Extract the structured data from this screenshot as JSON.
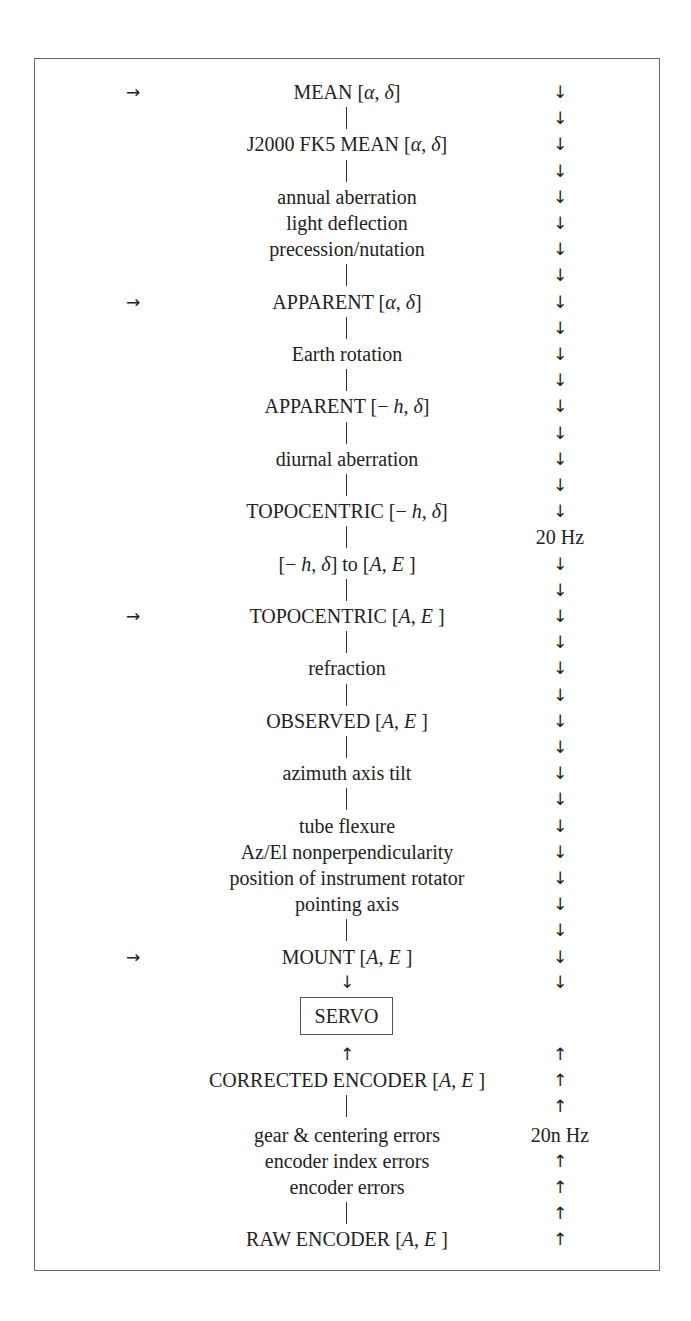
{
  "diagram": {
    "row_top_y": 79,
    "row_pitch": 26.2,
    "down_arrow": "↓",
    "up_arrow": "↑",
    "right_arrow": "→",
    "rows": [
      {
        "text": "MEAN [α, δ]",
        "left": "→",
        "right": "↓"
      },
      {
        "text": "|",
        "right": "↓"
      },
      {
        "text": "J2000 FK5 MEAN [α, δ]",
        "right": "↓"
      },
      {
        "text": "|",
        "right": "↓"
      },
      {
        "text": "annual aberration",
        "right": "↓"
      },
      {
        "text": "light deflection",
        "right": "↓"
      },
      {
        "text": "precession/nutation",
        "right": "↓"
      },
      {
        "text": "|",
        "right": "↓"
      },
      {
        "text": "APPARENT [α, δ]",
        "left": "→",
        "right": "↓"
      },
      {
        "text": "|",
        "right": "↓"
      },
      {
        "text": "Earth rotation",
        "right": "↓"
      },
      {
        "text": "|",
        "right": "↓"
      },
      {
        "text": "APPARENT [− h, δ]",
        "right": "↓"
      },
      {
        "text": "|",
        "right": "↓"
      },
      {
        "text": "diurnal aberration",
        "right": "↓"
      },
      {
        "text": "|",
        "right": "↓"
      },
      {
        "text": "TOPOCENTRIC [− h, δ]",
        "right": "↓"
      },
      {
        "text": "|",
        "right": "20 Hz"
      },
      {
        "text": "[− h, δ] to [A, E]",
        "right": "↓"
      },
      {
        "text": "|",
        "right": "↓"
      },
      {
        "text": "TOPOCENTRIC [A, E]",
        "left": "→",
        "right": "↓"
      },
      {
        "text": "|",
        "right": "↓"
      },
      {
        "text": "refraction",
        "right": "↓"
      },
      {
        "text": "|",
        "right": "↓"
      },
      {
        "text": "OBSERVED [A, E]",
        "right": "↓"
      },
      {
        "text": "|",
        "right": "↓"
      },
      {
        "text": "azimuth axis tilt",
        "right": "↓"
      },
      {
        "text": "|",
        "right": "↓"
      },
      {
        "text": "tube flexure",
        "right": "↓"
      },
      {
        "text": "Az/El nonperpendicularity",
        "right": "↓"
      },
      {
        "text": "position of instrument rotator",
        "right": "↓"
      },
      {
        "text": "pointing axis",
        "right": "↓"
      },
      {
        "text": "|",
        "right": "↓"
      },
      {
        "text": "MOUNT [A, E]",
        "left": "→",
        "right": "↓"
      },
      {
        "text": "↓",
        "right": "↓"
      }
    ],
    "servo_label": "SERVO",
    "bottom_rows": [
      {
        "text": "↑",
        "right": "↑"
      },
      {
        "text": "CORRECTED ENCODER [A, E]",
        "right": "↑"
      },
      {
        "text": "|",
        "right": "↑"
      },
      {
        "text": "gear & centering errors",
        "right": "20n Hz"
      },
      {
        "text": "encoder index errors",
        "right": "↑"
      },
      {
        "text": "encoder errors",
        "right": "↑"
      },
      {
        "text": "|",
        "right": "↑"
      },
      {
        "text": "RAW ENCODER [A, E]",
        "right": "↑"
      }
    ],
    "rate_top": "20 Hz",
    "rate_bottom": "20n Hz"
  }
}
